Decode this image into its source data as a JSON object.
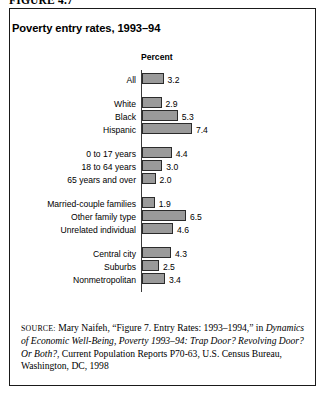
{
  "figure": {
    "number_label": "FIGURE 4.7",
    "title": "Poverty entry rates, 1993–94"
  },
  "chart_data": {
    "type": "bar",
    "orientation": "horizontal",
    "title": "Poverty entry rates, 1993–94",
    "xlabel": "Percent",
    "ylabel": "",
    "axis_header": "Percent",
    "xlim": [
      0,
      8
    ],
    "grid": false,
    "legend": "none",
    "bar_fill_color": "#9a9a9a",
    "bar_border_color": "#2b2b2b",
    "groups": [
      {
        "name": "total",
        "categories": [
          "All"
        ],
        "values": [
          3.2
        ]
      },
      {
        "name": "race-ethnicity",
        "categories": [
          "White",
          "Black",
          "Hispanic"
        ],
        "values": [
          2.9,
          5.3,
          7.4
        ]
      },
      {
        "name": "age",
        "categories": [
          "0 to 17 years",
          "18 to 64 years",
          "65 years and over"
        ],
        "values": [
          4.4,
          3.0,
          2.0
        ]
      },
      {
        "name": "family-type",
        "categories": [
          "Married-couple families",
          "Other family type",
          "Unrelated individual"
        ],
        "values": [
          1.9,
          6.5,
          4.6
        ]
      },
      {
        "name": "residence",
        "categories": [
          "Central city",
          "Suburbs",
          "Nonmetropolitan"
        ],
        "values": [
          4.3,
          2.5,
          3.4
        ]
      }
    ],
    "categories": [
      "All",
      "White",
      "Black",
      "Hispanic",
      "0 to 17 years",
      "18 to 64 years",
      "65 years and over",
      "Married-couple families",
      "Other family type",
      "Unrelated individual",
      "Central city",
      "Suburbs",
      "Nonmetropolitan"
    ],
    "values": [
      3.2,
      2.9,
      5.3,
      7.4,
      4.4,
      3.0,
      2.0,
      1.9,
      6.5,
      4.6,
      4.3,
      2.5,
      3.4
    ],
    "value_labels": [
      "3.2",
      "2.9",
      "5.3",
      "7.4",
      "4.4",
      "3.0",
      "2.0",
      "1.9",
      "6.5",
      "4.6",
      "4.3",
      "2.5",
      "3.4"
    ]
  },
  "source": {
    "prefix": "SOURCE:",
    "text_1": " Mary Naifeh, “Figure 7. Entry Rates: 1993–1994,” in ",
    "italic_1": "Dynamics of Economic Well-Being, Poverty 1993–94: Trap Door? Revolving Door? Or Both?",
    "text_2": ", Current Population Reports P70-63, U.S. Census Bureau, Washington, DC, 1998"
  }
}
